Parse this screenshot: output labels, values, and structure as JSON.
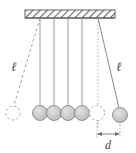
{
  "figure": {
    "labels": {
      "length_left": "ℓ",
      "length_right": "ℓ",
      "separation": "d"
    },
    "colors": {
      "ball_fill": "#c9c9c9",
      "ball_stroke": "#8a8a8a",
      "string": "#8f8f8f",
      "ceiling_stroke": "#555555",
      "hatch": "#6b6b6b",
      "dashed": "#9a9a9a",
      "dotted": "#a8a8a8",
      "label": "#4a4a4a",
      "background": "#ffffff"
    },
    "geometry": {
      "ceiling": {
        "x": 25,
        "y": 10,
        "width": 90,
        "height": 8
      },
      "pivot_y": 18,
      "ball_radius": 7.5,
      "rest_ball_centers_x": [
        40,
        54,
        68,
        82,
        97
      ],
      "rest_ball_center_y": 113,
      "swung_left_ball": {
        "cx": 13,
        "cy": 113,
        "pivot_x": 40,
        "dashed": true
      },
      "swung_right_ball": {
        "cx": 120,
        "cy": 115,
        "pivot_x": 98,
        "dashed": false
      },
      "phantom_ball": {
        "cx": 97,
        "cy": 113,
        "dashed": true
      },
      "dotted_vertical": {
        "x": 98,
        "y1": 18,
        "y2": 128
      },
      "dimension": {
        "x1": 97,
        "x2": 120,
        "y": 134
      }
    },
    "elements": {
      "ceiling_support": "hatched-ceiling",
      "strings": "pendulum-strings",
      "balls": "pendulum-balls"
    }
  }
}
